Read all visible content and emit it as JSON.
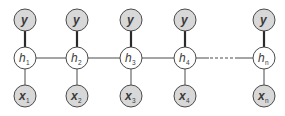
{
  "diagram": {
    "type": "graphical-model",
    "colors": {
      "observed_fill": "#d8d8d8",
      "hidden_fill": "#ffffff",
      "stroke": "#4a4a4a"
    },
    "columns": [
      {
        "id": "1",
        "y_label": "y",
        "h_label": "h",
        "h_sub": "1",
        "x_label": "x",
        "x_sub": "1"
      },
      {
        "id": "2",
        "y_label": "y",
        "h_label": "h",
        "h_sub": "2",
        "x_label": "x",
        "x_sub": "2"
      },
      {
        "id": "3",
        "y_label": "y",
        "h_label": "h",
        "h_sub": "3",
        "x_label": "x",
        "x_sub": "3"
      },
      {
        "id": "4",
        "y_label": "y",
        "h_label": "h",
        "h_sub": "4",
        "x_label": "x",
        "x_sub": "4"
      },
      {
        "id": "n",
        "y_label": "y",
        "h_label": "h",
        "h_sub": "n",
        "x_label": "x",
        "x_sub": "n"
      }
    ],
    "edges": [
      {
        "from": "h1",
        "to": "h2",
        "style": "solid"
      },
      {
        "from": "h2",
        "to": "h3",
        "style": "solid"
      },
      {
        "from": "h3",
        "to": "h4",
        "style": "solid"
      },
      {
        "from": "h4",
        "to": "hn",
        "style": "dashed-ellipsis"
      }
    ]
  }
}
